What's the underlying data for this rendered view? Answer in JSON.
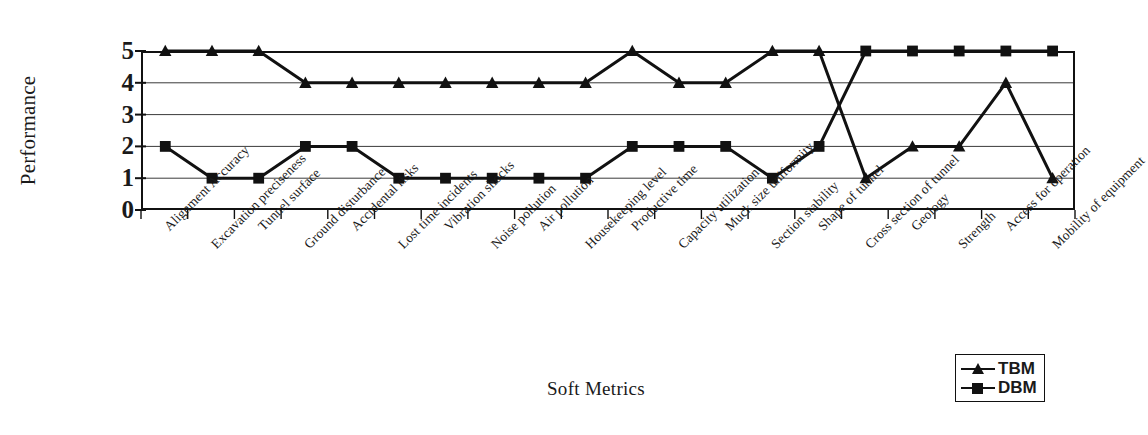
{
  "chart_data": {
    "type": "line",
    "title": "",
    "xlabel": "Soft Metrics",
    "ylabel": "Performance",
    "ylim": [
      0,
      5
    ],
    "yticks": [
      5,
      4,
      3,
      2,
      1,
      0
    ],
    "grid": true,
    "legend_position": "bottom-right",
    "categories": [
      "Alignment Accuracy",
      "Excavation preciseness",
      "Tunnel surface",
      "Ground disturbance",
      "Accidental risks",
      "Lost time incidents",
      "Vibration shocks",
      "Noise pollution",
      "Air pollution",
      "Housekeeping level",
      "Productive time",
      "Capacity utilization",
      "Muck size uniformity",
      "Section stability",
      "Shape of tunnel",
      "Cross section of tunnel",
      "Geology",
      "Strength",
      "Access for operation",
      "Mobility of equipment"
    ],
    "series": [
      {
        "name": "TBM",
        "marker": "triangle",
        "color": "#111111",
        "values": [
          5,
          5,
          5,
          4,
          4,
          4,
          4,
          4,
          4,
          4,
          5,
          4,
          4,
          5,
          5,
          1,
          2,
          2,
          4,
          1
        ]
      },
      {
        "name": "DBM",
        "marker": "square",
        "color": "#111111",
        "values": [
          2,
          1,
          1,
          2,
          2,
          1,
          1,
          1,
          1,
          1,
          2,
          2,
          2,
          1,
          2,
          5,
          5,
          5,
          5,
          5
        ]
      }
    ]
  },
  "legend": {
    "entries": [
      {
        "label": "TBM",
        "marker": "triangle-marker"
      },
      {
        "label": "DBM",
        "marker": "square-marker"
      }
    ]
  }
}
